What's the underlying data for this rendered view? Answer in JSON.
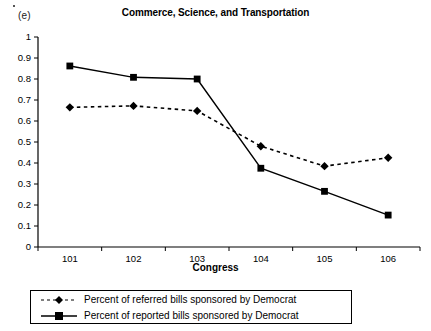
{
  "panel": {
    "label": "(e)"
  },
  "chart_data": {
    "type": "line",
    "title": "Commerce, Science, and Transportation",
    "xlabel": "Congress",
    "ylabel": "",
    "categories": [
      "101",
      "102",
      "103",
      "104",
      "105",
      "106"
    ],
    "ylim": [
      0,
      1
    ],
    "yticks": [
      "0",
      "0.1",
      "0.2",
      "0.3",
      "0.4",
      "0.5",
      "0.6",
      "0.7",
      "0.8",
      "0.9",
      "1"
    ],
    "ytick_values": [
      0,
      0.1,
      0.2,
      0.3,
      0.4,
      0.5,
      0.6,
      0.7,
      0.8,
      0.9,
      1
    ],
    "grid": false,
    "legend_position": "bottom",
    "series": [
      {
        "name": "Percent of referred bills sponsored by Democrat",
        "marker": "diamond",
        "line_style": "dashed",
        "color": "#000000",
        "values": [
          0.665,
          0.672,
          0.648,
          0.48,
          0.385,
          0.425
        ]
      },
      {
        "name": "Percent of reported bills sponsored by Democrat",
        "marker": "square",
        "line_style": "solid",
        "color": "#000000",
        "values": [
          0.862,
          0.808,
          0.8,
          0.375,
          0.265,
          0.152
        ]
      }
    ]
  }
}
